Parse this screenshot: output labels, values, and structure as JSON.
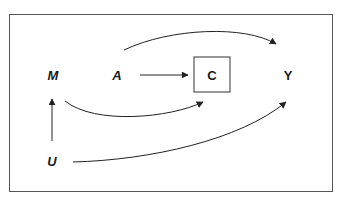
{
  "diagram": {
    "type": "causal-dag",
    "nodes": [
      {
        "id": "M",
        "label": "M",
        "x": 53,
        "y": 75,
        "boxed": false,
        "italic": true
      },
      {
        "id": "A",
        "label": "A",
        "x": 117,
        "y": 75,
        "boxed": false,
        "italic": true
      },
      {
        "id": "C",
        "label": "C",
        "x": 212,
        "y": 75,
        "boxed": true,
        "italic": false
      },
      {
        "id": "Y",
        "label": "Y",
        "x": 288,
        "y": 75,
        "boxed": false,
        "italic": false
      },
      {
        "id": "U",
        "label": "U",
        "x": 52,
        "y": 161,
        "boxed": false,
        "italic": true
      }
    ],
    "edges": [
      {
        "from": "A",
        "to": "C",
        "style": "straight"
      },
      {
        "from": "A",
        "to": "Y",
        "style": "curved"
      },
      {
        "from": "M",
        "to": "C",
        "style": "curved"
      },
      {
        "from": "U",
        "to": "M",
        "style": "straight"
      },
      {
        "from": "U",
        "to": "Y",
        "style": "curved"
      }
    ],
    "colors": {
      "stroke": "#222222",
      "frame": "#555555"
    }
  }
}
